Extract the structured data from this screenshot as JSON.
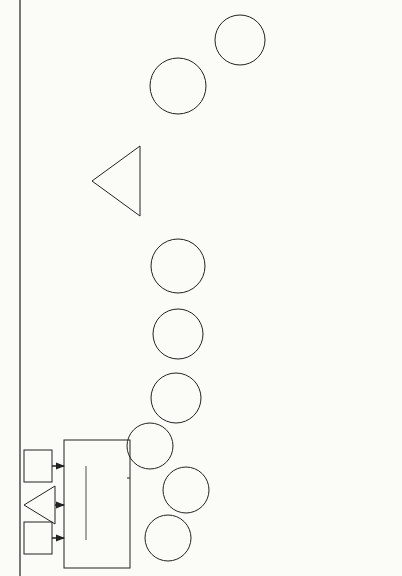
{
  "figure": {
    "number": "Figure 3.1"
  },
  "legend": [
    {
      "label": "Planning",
      "style": "dotted"
    },
    {
      "label": "Budgeting",
      "style": "dashed"
    },
    {
      "label": "Design Approval",
      "style": "solid-thick"
    },
    {
      "label": "Implementation",
      "style": "long-dash"
    },
    {
      "label": "Reporting",
      "style": "solid-thin"
    },
    {
      "label": "Evaluation",
      "style": "dash-dot"
    }
  ],
  "inputs": {
    "legislation": "Legis-\nlation",
    "ldc_needs": "LDC\nNeeds",
    "foreign_policy": "Foreign\nPolicy"
  },
  "agency_policy": {
    "heading": "Agency Policy",
    "items": [
      "Global Sector Strategies",
      "Regional Strategies",
      "Research Strategy",
      "Management Objectives"
    ]
  },
  "nodes": {
    "ongoing_projects": "Ongoing\nProjects",
    "omb": "Office of\nManagement\nand Budget\n(OMB)",
    "budget_submissions": "Budget\nSubmissions",
    "congressional_presentation": "Congressional\nPresentation\n(CP)",
    "appropriation": "Appropriation",
    "oyb": "Operational\nYear Budget\n(OYB)",
    "host_country": "Host\nCountry",
    "evaluation": "Evaluation",
    "ex_post": "Ex-Post\nFacto\nEvaluation",
    "dap1": "Country\nProgram\nStrategy\n(DAPI)",
    "dap2": "Field of\nConcen-\ntration\nStrategy\n(DAP II)",
    "pid": "Project\nIdentification\nDocument\n(PID)",
    "prp": "Project\nReview Paper\n(PRP)",
    "pp": "Project\nPaper\n(PP)",
    "pre_implementation": "Pre-\nImplemen-\ntation",
    "implementation": "Implemen-\ntation",
    "prior_evaluation": "Prior\nEvaluation"
  },
  "project_reporting": {
    "heading": "Project Reporting",
    "body": "Project\nPerformance\nTracking (PPT)\nand Financial\nReporting"
  },
  "mis": {
    "title": "MANAGEMENT\nINFORMATION\nSYSTEM",
    "left_items": [
      "Financial",
      "Programming",
      "Implementation",
      "Program Support",
      "Personnel Administration Support"
    ],
    "right_items": [
      "Management Reports",
      "External Needs",
      "Data Bank (CPDB, PAIS, DIS, ESDB)",
      "Data Base for Future Decisions, Policy"
    ],
    "lessons": [
      "Lessons Learned",
      "Evaluation Criteria"
    ]
  }
}
